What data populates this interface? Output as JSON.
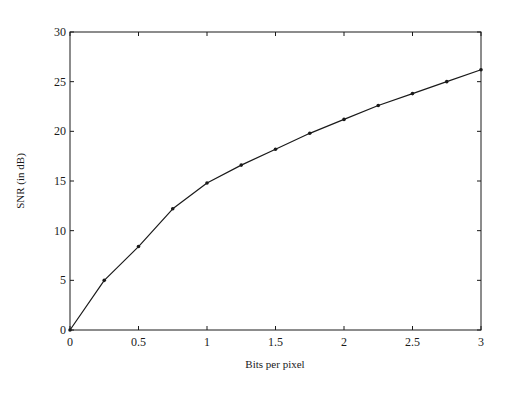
{
  "chart_data": {
    "type": "line",
    "title": "",
    "xlabel": "Bits per pixel",
    "ylabel": "SNR (in dB)",
    "xlim": [
      0,
      3
    ],
    "ylim": [
      0,
      30
    ],
    "x_ticks": [
      0,
      0.5,
      1,
      1.5,
      2,
      2.5,
      3
    ],
    "x_tick_labels": [
      "0",
      "0.5",
      "1",
      "1.5",
      "2",
      "2.5",
      "3"
    ],
    "y_ticks": [
      0,
      5,
      10,
      15,
      20,
      25,
      30
    ],
    "y_tick_labels": [
      "0",
      "5",
      "10",
      "15",
      "20",
      "25",
      "30"
    ],
    "grid": false,
    "legend": null,
    "series": [
      {
        "name": "SNR",
        "marker": "dot",
        "color": "#1a1a1a",
        "x": [
          0,
          0.25,
          0.5,
          0.75,
          1.0,
          1.25,
          1.5,
          1.75,
          2.0,
          2.25,
          2.5,
          2.75,
          3.0
        ],
        "values": [
          0,
          5.0,
          8.4,
          12.2,
          14.8,
          16.6,
          18.2,
          19.8,
          21.2,
          22.6,
          23.8,
          25.0,
          26.2
        ]
      }
    ]
  }
}
